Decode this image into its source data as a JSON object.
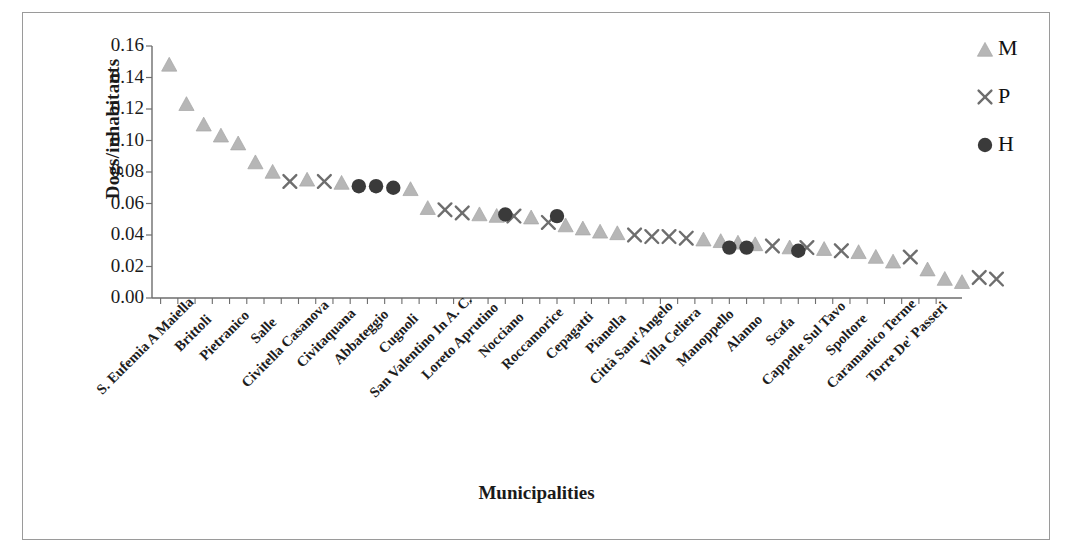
{
  "axes": {
    "ylabel": "Dogs/inhabitants",
    "xlabel": "Municipalities",
    "yticks": [
      "0.00",
      "0.02",
      "0.04",
      "0.06",
      "0.08",
      "0.10",
      "0.12",
      "0.14",
      "0.16"
    ]
  },
  "legend": {
    "position": "top-right",
    "items": [
      {
        "label": "M",
        "marker": "triangle",
        "color": "#b3b3b3",
        "icon": "triangle-marker-icon"
      },
      {
        "label": "P",
        "marker": "cross",
        "color": "#6e6e6e",
        "icon": "cross-marker-icon"
      },
      {
        "label": "H",
        "marker": "circle",
        "color": "#3a3a3a",
        "icon": "circle-marker-icon"
      }
    ]
  },
  "chart_data": {
    "type": "scatter",
    "title": "",
    "xlabel": "Municipalities",
    "ylabel": "Dogs/inhabitants",
    "ylim": [
      0.0,
      0.16
    ],
    "ytick_step": 0.02,
    "grid": false,
    "legend_position": "top-right",
    "categories": [
      "S. Eufemia A Maiella",
      "Roccacaramanico",
      "Brittoli",
      "Pescosansonesco",
      "Pietranico",
      "Bolognano",
      "Salle",
      "Musellaro",
      "Civitella Casanova",
      "Carpineto",
      "Civitaquana",
      "Vicoli",
      "Abbateggio",
      "Catignano",
      "Cugnoli",
      "Corvara",
      "San Valentino In A. C.",
      "Turrivalignani",
      "Loreto Aprutino",
      "Penne",
      "Nocciano",
      "Collecorvino",
      "Roccamorice",
      "Farindola",
      "Cepagatti",
      "Montebello",
      "Pianella",
      "Rosciano",
      "Città Sant'Angelo",
      "Elice",
      "Villa Celiera",
      "Picciano",
      "Manoppello",
      "Moscufo",
      "Alanno",
      "Lettomanoppello",
      "Scafa",
      "Serramonacesca",
      "Cappelle Sul Tavo",
      "Bussi",
      "Spoltore",
      "Castiglione",
      "Caramanico Terme",
      "Popoli",
      "Torre De' Passeri",
      "Tocco"
    ],
    "axis_tick_labels_shown": [
      "S. Eufemia A Maiella",
      "Brittoli",
      "Pietranico",
      "Salle",
      "Civitella Casanova",
      "Civitaquana",
      "Abbateggio",
      "Cugnoli",
      "San Valentino In A. C.",
      "Loreto Aprutino",
      "Nocciano",
      "Roccamorice",
      "Cepagatti",
      "Pianella",
      "Città Sant'Angelo",
      "Villa Celiera",
      "Manoppello",
      "Alanno",
      "Scafa",
      "Cappelle Sul Tavo",
      "Spoltore",
      "Caramanico Terme",
      "Torre De' Passeri"
    ],
    "series": [
      {
        "name": "M",
        "marker": "triangle",
        "color": "#b3b3b3",
        "points": [
          {
            "i": 0,
            "y": 0.148
          },
          {
            "i": 1,
            "y": 0.123
          },
          {
            "i": 2,
            "y": 0.11
          },
          {
            "i": 3,
            "y": 0.103
          },
          {
            "i": 4,
            "y": 0.098
          },
          {
            "i": 5,
            "y": 0.086
          },
          {
            "i": 6,
            "y": 0.08
          },
          {
            "i": 8,
            "y": 0.075
          },
          {
            "i": 10,
            "y": 0.073
          },
          {
            "i": 14,
            "y": 0.069
          },
          {
            "i": 15,
            "y": 0.057
          },
          {
            "i": 18,
            "y": 0.053
          },
          {
            "i": 19,
            "y": 0.052
          },
          {
            "i": 21,
            "y": 0.051
          },
          {
            "i": 23,
            "y": 0.046
          },
          {
            "i": 24,
            "y": 0.044
          },
          {
            "i": 25,
            "y": 0.042
          },
          {
            "i": 26,
            "y": 0.041
          },
          {
            "i": 31,
            "y": 0.037
          },
          {
            "i": 32,
            "y": 0.036
          },
          {
            "i": 33,
            "y": 0.035
          },
          {
            "i": 34,
            "y": 0.034
          },
          {
            "i": 36,
            "y": 0.032
          },
          {
            "i": 38,
            "y": 0.031
          },
          {
            "i": 40,
            "y": 0.029
          },
          {
            "i": 41,
            "y": 0.026
          },
          {
            "i": 42,
            "y": 0.023
          },
          {
            "i": 44,
            "y": 0.018
          },
          {
            "i": 45,
            "y": 0.012
          },
          {
            "i": 46,
            "y": 0.01
          }
        ]
      },
      {
        "name": "P",
        "marker": "cross",
        "color": "#6e6e6e",
        "points": [
          {
            "i": 7,
            "y": 0.074
          },
          {
            "i": 9,
            "y": 0.074
          },
          {
            "i": 16,
            "y": 0.056
          },
          {
            "i": 17,
            "y": 0.054
          },
          {
            "i": 20,
            "y": 0.052
          },
          {
            "i": 22,
            "y": 0.048
          },
          {
            "i": 27,
            "y": 0.04
          },
          {
            "i": 28,
            "y": 0.039
          },
          {
            "i": 29,
            "y": 0.039
          },
          {
            "i": 30,
            "y": 0.038
          },
          {
            "i": 35,
            "y": 0.033
          },
          {
            "i": 37,
            "y": 0.032
          },
          {
            "i": 39,
            "y": 0.03
          },
          {
            "i": 43,
            "y": 0.026
          },
          {
            "i": 47,
            "y": 0.013
          },
          {
            "i": 48,
            "y": 0.012
          }
        ]
      },
      {
        "name": "H",
        "marker": "circle",
        "color": "#3a3a3a",
        "points": [
          {
            "i": 11,
            "y": 0.071
          },
          {
            "i": 12,
            "y": 0.071
          },
          {
            "i": 13,
            "y": 0.07
          },
          {
            "i": 19.5,
            "y": 0.053
          },
          {
            "i": 22.5,
            "y": 0.052
          },
          {
            "i": 32.5,
            "y": 0.032
          },
          {
            "i": 33.5,
            "y": 0.032
          },
          {
            "i": 36.5,
            "y": 0.03
          }
        ]
      }
    ]
  }
}
